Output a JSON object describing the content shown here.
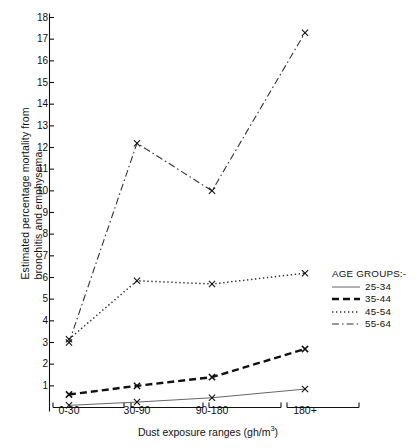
{
  "chart_data": {
    "type": "line",
    "title": "",
    "xlabel": "Dust exposure ranges (gh/m3)",
    "xlabel_base": "Dust exposure ranges (gh/m",
    "xlabel_sup": "3",
    "xlabel_tail": ")",
    "ylabel_line1": "Estimated percentage mortality from",
    "ylabel_line2": "bronchitis and emphysema",
    "categories": [
      "0-30",
      "30-90",
      "90-180",
      "180+"
    ],
    "ylim": [
      0,
      18
    ],
    "yticks": [
      1,
      2,
      3,
      4,
      5,
      6,
      7,
      8,
      9,
      10,
      11,
      12,
      13,
      14,
      15,
      16,
      17,
      18
    ],
    "grid": false,
    "legend_position": "right",
    "legend_title": "AGE GROUPS:-",
    "marker": "x",
    "series": [
      {
        "name": "25-34",
        "values": [
          0.1,
          0.25,
          0.45,
          0.85
        ],
        "style": "solid",
        "color": "#555555"
      },
      {
        "name": "35-44",
        "values": [
          0.6,
          1.0,
          1.4,
          2.7
        ],
        "style": "dashed",
        "color": "#111111"
      },
      {
        "name": "45-54",
        "values": [
          3.15,
          5.85,
          5.7,
          6.2
        ],
        "style": "dotted",
        "color": "#333333"
      },
      {
        "name": "55-64",
        "values": [
          3.0,
          12.2,
          10.0,
          17.3
        ],
        "style": "dashdot",
        "color": "#333333"
      }
    ]
  },
  "axis": {
    "y_tick_labels": [
      "18",
      "17",
      "16",
      "15",
      "14",
      "13",
      "12",
      "11",
      "10",
      "9",
      "8",
      "7",
      "6",
      "5",
      "4",
      "3",
      "2",
      "1"
    ],
    "x_tick_labels": [
      "0-30",
      "30-90",
      "90-180",
      "180+"
    ]
  },
  "legend": {
    "title": "AGE GROUPS:-",
    "items": [
      {
        "label": "25-34"
      },
      {
        "label": "35-44"
      },
      {
        "label": "45-54"
      },
      {
        "label": "55-64"
      }
    ]
  }
}
